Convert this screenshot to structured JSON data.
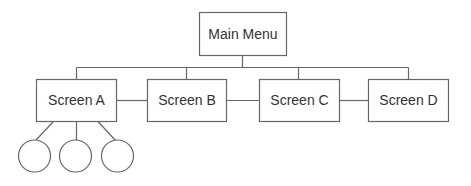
{
  "diagram": {
    "type": "navigation-hierarchy",
    "root": {
      "label": "Main Menu"
    },
    "screens": [
      {
        "label": "Screen A"
      },
      {
        "label": "Screen B"
      },
      {
        "label": "Screen C"
      },
      {
        "label": "Screen D"
      }
    ],
    "sub_nodes_of_screen_a": 3,
    "colors": {
      "stroke": "#666666",
      "text": "#333333",
      "background": "#ffffff"
    }
  }
}
